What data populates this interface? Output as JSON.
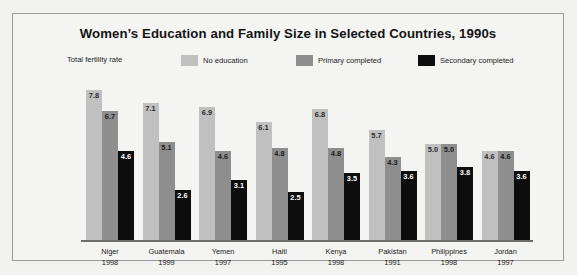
{
  "chart_data": {
    "type": "bar",
    "title": "Women’s Education and Family Size in Selected Countries, 1990s",
    "xlabel": "",
    "ylabel": "Total fertility rate",
    "ylim": [
      0,
      8.2
    ],
    "grid": false,
    "legend_position": "top",
    "legend_note": "Total fertility rate",
    "categories": [
      "Niger",
      "Guatemala",
      "Yemen",
      "Haiti",
      "Kenya",
      "Pakistan",
      "Philippines",
      "Jordan"
    ],
    "category_years": [
      "1998",
      "1999",
      "1997",
      "1995",
      "1998",
      "1991",
      "1998",
      "1997"
    ],
    "series": [
      {
        "name": "No education",
        "color": "#c0c0c0",
        "values": [
          7.8,
          7.1,
          6.9,
          6.1,
          6.8,
          5.7,
          5.0,
          4.6
        ]
      },
      {
        "name": "Primary completed",
        "color": "#8e8e8e",
        "values": [
          6.7,
          5.1,
          4.6,
          4.8,
          4.8,
          4.3,
          5.0,
          4.6
        ]
      },
      {
        "name": "Secondary completed",
        "color": "#0d0d0d",
        "values": [
          4.6,
          2.6,
          3.1,
          2.5,
          3.5,
          3.6,
          3.8,
          3.6
        ]
      }
    ]
  }
}
